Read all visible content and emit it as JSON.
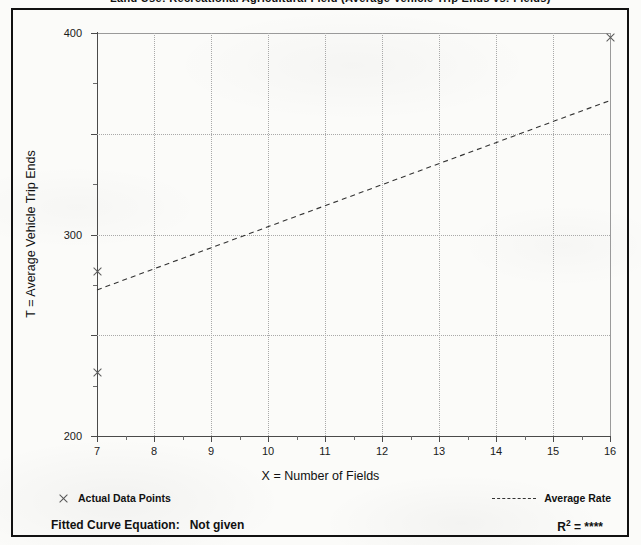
{
  "figure": {
    "top_cut_text": "Land Use: Recreational Agricultural Field  (Average Vehicle Trip Ends vs: Fields)"
  },
  "chart_data": {
    "type": "scatter",
    "title": "",
    "xlabel": "X = Number of Fields",
    "ylabel": "T = Average Vehicle Trip Ends",
    "xlim": [
      7,
      16
    ],
    "ylim": [
      0,
      400
    ],
    "grid": true,
    "x_ticks": [
      7,
      8,
      9,
      10,
      11,
      12,
      13,
      14,
      15,
      16
    ],
    "x_tick_labels": [
      "7",
      "8",
      "9",
      "10",
      "11",
      "12",
      "13",
      "14",
      "15",
      "16"
    ],
    "x_minor_tick_step": 0.5,
    "y_ticks": [
      0,
      100,
      200,
      300,
      400
    ],
    "y_tick_labels": [
      "0",
      "100",
      "200",
      "300",
      "400"
    ],
    "y_minor_tick_step": 50,
    "gridlines_x": [
      8,
      9,
      10,
      11,
      12,
      13,
      14,
      15
    ],
    "gridlines_y": [
      100,
      200,
      300
    ],
    "series": [
      {
        "name": "Actual Data Points",
        "type": "scatter",
        "marker": "x",
        "color": "#555555",
        "points": [
          {
            "x": 7,
            "y": 163
          },
          {
            "x": 7,
            "y": 63
          },
          {
            "x": 16,
            "y": 396
          }
        ]
      },
      {
        "name": "Average Rate",
        "type": "line",
        "style": "dashed",
        "color": "#333333",
        "points": [
          {
            "x": 7,
            "y": 145
          },
          {
            "x": 16,
            "y": 333
          }
        ]
      }
    ],
    "legend": {
      "position": "below-plot",
      "entries": [
        {
          "label": "Actual Data Points",
          "symbol": "x-marker"
        },
        {
          "label": "Average Rate",
          "symbol": "dashed-line"
        }
      ]
    },
    "annotations": {
      "fitted_curve_label": "Fitted Curve Equation:",
      "fitted_curve_value": "Not given",
      "r_squared_label": "R",
      "r_squared_exponent": "2",
      "r_squared_equals": "=",
      "r_squared_value": "****"
    }
  }
}
